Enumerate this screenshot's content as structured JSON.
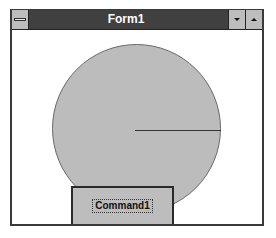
{
  "window": {
    "title": "Form1",
    "system_menu_icon": "system-menu-icon",
    "minimize_icon": "minimize-arrow-icon",
    "maximize_icon": "maximize-arrow-icon"
  },
  "client": {
    "shape": {
      "type": "circle",
      "fill_color": "#bcbcbc",
      "border_color": "#6a6a6a",
      "radius_line_color": "#333333"
    },
    "command_button": {
      "label": "Command1"
    }
  },
  "colors": {
    "titlebar": "#2e2e2e",
    "title_text": "#ffffff",
    "button_face": "#bdbdbd",
    "background": "#ffffff"
  }
}
